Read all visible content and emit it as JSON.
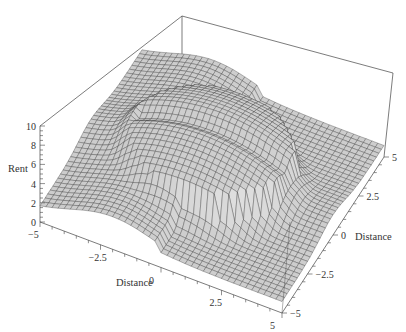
{
  "chart_data": {
    "type": "surface3d",
    "title": "",
    "xlabel": "Distance",
    "ylabel": "Distance",
    "zlabel": "Rent",
    "x_ticks": [
      "-5",
      "-2.5",
      "0",
      "2.5",
      "5"
    ],
    "y_ticks": [
      "-5",
      "-2.5",
      "0",
      "2.5",
      "5"
    ],
    "z_ticks": [
      "0",
      "2",
      "4",
      "6",
      "8",
      "10"
    ],
    "xlim": [
      -5,
      5
    ],
    "ylim": [
      -5,
      5
    ],
    "zlim": [
      0,
      10
    ],
    "surface_color": "#c8c8c8",
    "mesh_color": "#333333",
    "grid_resolution": 40,
    "box": true
  },
  "axes": {
    "z_title": "Rent",
    "x_title": "Distance",
    "y_title": "Distance"
  }
}
